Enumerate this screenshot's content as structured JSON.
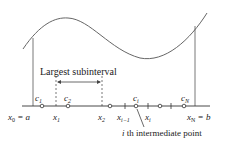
{
  "diagram": {
    "title_label": "Largest subinterval",
    "annotation": "i th intermediate point",
    "annotation_parts": {
      "i": "i",
      "rest": " th intermediate point"
    },
    "endpoints": {
      "left": {
        "var": "x",
        "sub": "0",
        "eq": " = a"
      },
      "right": {
        "var": "x",
        "sub": "N",
        "eq": " = b"
      }
    },
    "x_labels": [
      {
        "var": "x",
        "sub": "1"
      },
      {
        "var": "x",
        "sub": "2"
      },
      {
        "var": "x",
        "sub": "i−1"
      },
      {
        "var": "x",
        "sub": "i"
      }
    ],
    "c_labels": [
      {
        "var": "c",
        "sub": "1"
      },
      {
        "var": "c",
        "sub": "2"
      },
      {
        "var": "c",
        "sub": "i"
      },
      {
        "var": "c",
        "sub": "N"
      }
    ],
    "colors": {
      "curve": "#555555",
      "axis": "#333333",
      "text": "#222222"
    }
  }
}
